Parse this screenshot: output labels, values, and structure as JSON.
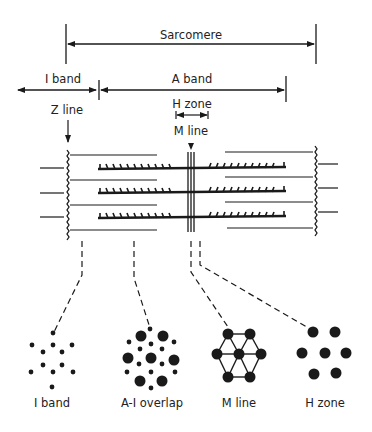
{
  "diagram": {
    "labels": {
      "sarcomere": "Sarcomere",
      "i_band": "I band",
      "a_band": "A band",
      "h_zone": "H zone",
      "z_line": "Z line",
      "m_line": "M line"
    },
    "cross_sections": [
      {
        "id": "i-band",
        "label": "I band"
      },
      {
        "id": "a-i-overlap",
        "label": "A-I overlap"
      },
      {
        "id": "m-line",
        "label": "M line"
      },
      {
        "id": "h-zone",
        "label": "H zone"
      }
    ],
    "colors": {
      "ink": "#1a1a1a",
      "background": "#ffffff"
    }
  }
}
